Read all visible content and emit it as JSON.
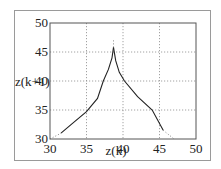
{
  "chart_data": {
    "type": "line",
    "title": "",
    "xlabel": "z(k)",
    "ylabel": "z(k+1)",
    "xlim": [
      30,
      50
    ],
    "ylim": [
      30,
      50
    ],
    "xticks": [
      30,
      35,
      40,
      45,
      50
    ],
    "yticks": [
      30,
      35,
      40,
      45,
      50
    ],
    "grid": true,
    "legend": null,
    "series": [
      {
        "name": "left-branch",
        "style": "solid",
        "x": [
          31.5,
          33,
          35,
          36.5,
          37.3,
          38,
          38.5,
          38.7
        ],
        "y": [
          31.0,
          32.6,
          34.7,
          37.0,
          40.0,
          42.0,
          44.0,
          45.8
        ]
      },
      {
        "name": "right-branch",
        "style": "solid",
        "x": [
          38.7,
          39.0,
          39.5,
          40.2,
          42,
          44,
          45.5
        ],
        "y": [
          45.8,
          43.5,
          41.5,
          40.0,
          37.3,
          35.0,
          31.5
        ]
      },
      {
        "name": "left-extension",
        "style": "dotted",
        "x": [
          30.0,
          31.5
        ],
        "y": [
          30.0,
          31.0
        ]
      },
      {
        "name": "right-extension",
        "style": "dotted",
        "x": [
          45.5,
          47.0
        ],
        "y": [
          31.5,
          30.0
        ]
      },
      {
        "name": "peak-extension",
        "style": "dotted",
        "x": [
          38.7,
          38.7
        ],
        "y": [
          45.8,
          47.0
        ]
      }
    ]
  },
  "axes": {
    "x_tick_labels": [
      "30",
      "35",
      "40",
      "45",
      "50"
    ],
    "y_tick_labels": [
      "30",
      "35",
      "40",
      "45",
      "50"
    ],
    "xlabel": "z(k)",
    "ylabel": "z(k+1)"
  },
  "colors": {
    "curve": "#222222",
    "grid": "#8a8a8a",
    "axes": "#555555",
    "frame": "#9a9a9a"
  }
}
